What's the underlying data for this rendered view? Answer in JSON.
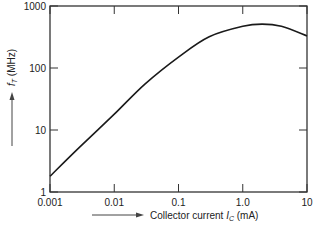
{
  "chart_data": {
    "type": "line",
    "title": "",
    "xlabel": "Collector current I_C (mA)",
    "ylabel": "f_T (MHz)",
    "xscale": "log",
    "yscale": "log",
    "xlim": [
      0.001,
      10
    ],
    "ylim": [
      1,
      1000
    ],
    "x_ticks": [
      "0.001",
      "0.01",
      "0.1",
      "1.0",
      "10"
    ],
    "y_ticks": [
      "1",
      "10",
      "100",
      "1000"
    ],
    "grid": false,
    "legend": null,
    "series": [
      {
        "name": "f_T",
        "x": [
          0.001,
          0.003,
          0.01,
          0.03,
          0.1,
          0.3,
          1.0,
          2.0,
          4.0,
          10
        ],
        "values": [
          1.8,
          5.5,
          18,
          55,
          150,
          320,
          470,
          510,
          470,
          330
        ]
      }
    ]
  },
  "labels": {
    "y_axis_prefix": "f",
    "y_axis_sub": "T",
    "y_axis_unit": " (MHz)",
    "x_axis_prefix": "Collector current ",
    "x_axis_var": "I",
    "x_axis_sub": "C",
    "x_axis_unit": " (mA)"
  },
  "colors": {
    "line": "#1a1a1a",
    "axis": "#333333"
  }
}
